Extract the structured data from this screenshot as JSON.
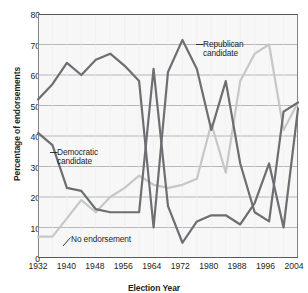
{
  "chart_data": {
    "type": "line",
    "title": "",
    "xlabel": "Election Year",
    "ylabel": "Percentage of endorsements",
    "xlim": [
      1932,
      2004
    ],
    "ylim": [
      0,
      80
    ],
    "ytick_step": 10,
    "xtick_step": 8,
    "grid": true,
    "legend": "inline-annotations",
    "yticks": [
      "0",
      "10",
      "20",
      "30",
      "40",
      "50",
      "60",
      "70",
      "80"
    ],
    "xticks": [
      "1932",
      "1940",
      "1948",
      "1956",
      "1964",
      "1972",
      "1980",
      "1988",
      "1996",
      "2004"
    ],
    "x": [
      1932,
      1936,
      1940,
      1944,
      1948,
      1952,
      1956,
      1960,
      1964,
      1968,
      1972,
      1976,
      1980,
      1984,
      1988,
      1992,
      1996,
      2000,
      2004
    ],
    "series": [
      {
        "name": "Republican candidate",
        "color": "#6d6e71",
        "values": [
          52,
          57,
          64,
          60,
          65,
          67,
          63,
          58,
          10,
          61,
          71.5,
          62,
          42,
          58,
          31,
          15,
          12,
          48,
          51
        ]
      },
      {
        "name": "Democratic candidate",
        "color": "#6d6e71",
        "values": [
          41,
          37,
          23,
          22,
          16,
          15,
          15,
          15,
          62,
          17,
          5,
          12,
          14,
          14,
          11,
          18,
          31,
          10,
          49
        ]
      },
      {
        "name": "No endorsement",
        "color": "#c6c7c9",
        "values": [
          7,
          7,
          13,
          19,
          15,
          20,
          23,
          27,
          24,
          23,
          24,
          26,
          44,
          28,
          58,
          67,
          70,
          42,
          51
        ]
      }
    ],
    "annotations": [
      {
        "id": "republican-candidate-label",
        "text": "Republican\ncandidate"
      },
      {
        "id": "democratic-candidate-label",
        "text": "Democratic\ncandidate"
      },
      {
        "id": "no-endorsement-label",
        "text": "No endorsement"
      }
    ]
  }
}
